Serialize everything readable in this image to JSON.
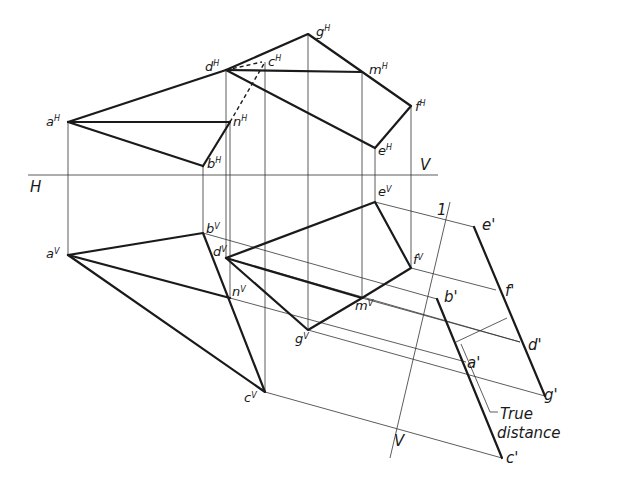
{
  "figure": {
    "plane_labels": {
      "horizontal": "H",
      "vertical": "V",
      "aux_line_top": "1",
      "aux_line_bottom": "V"
    },
    "top_view_labels": {
      "a": {
        "base": "a",
        "sup": "H"
      },
      "d": {
        "base": "d",
        "sup": "H"
      },
      "c": {
        "base": "c",
        "sup": "H"
      },
      "g": {
        "base": "g",
        "sup": "H"
      },
      "m": {
        "base": "m",
        "sup": "H"
      },
      "f": {
        "base": "f",
        "sup": "H"
      },
      "e": {
        "base": "e",
        "sup": "H"
      },
      "n": {
        "base": "n",
        "sup": "H"
      },
      "b": {
        "base": "b",
        "sup": "H"
      }
    },
    "front_view_labels": {
      "a": {
        "base": "a",
        "sup": "V"
      },
      "b": {
        "base": "b",
        "sup": "V"
      },
      "d": {
        "base": "d",
        "sup": "V"
      },
      "e": {
        "base": "e",
        "sup": "V"
      },
      "f": {
        "base": "f",
        "sup": "V"
      },
      "n": {
        "base": "n",
        "sup": "V"
      },
      "m": {
        "base": "m",
        "sup": "V"
      },
      "g": {
        "base": "g",
        "sup": "V"
      },
      "c": {
        "base": "c",
        "sup": "V"
      }
    },
    "aux_view_labels": {
      "e": "e'",
      "f": "f'",
      "d": "d'",
      "g": "g'",
      "b": "b'",
      "a": "a'",
      "c": "c'"
    },
    "annotation": {
      "line1": "True",
      "line2": "distance"
    }
  }
}
